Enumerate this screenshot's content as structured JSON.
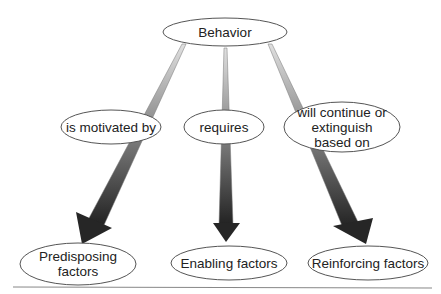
{
  "diagram": {
    "root": {
      "label": "Behavior"
    },
    "connectors": [
      {
        "label": "is motivated by"
      },
      {
        "label": "requires"
      },
      {
        "label": "will continue or extinguish based on",
        "lines": [
          "will continue or",
          "extinguish",
          "based on"
        ]
      }
    ],
    "targets": [
      {
        "label": "Predisposing factors",
        "lines": [
          "Predisposing",
          "factors"
        ]
      },
      {
        "label": "Enabling factors"
      },
      {
        "label": "Reinforcing factors"
      }
    ],
    "colors": {
      "arrow_dark": "#2a2a2a",
      "arrow_light": "#d8d8d8",
      "outline": "#555555",
      "rule": "#888888"
    }
  }
}
